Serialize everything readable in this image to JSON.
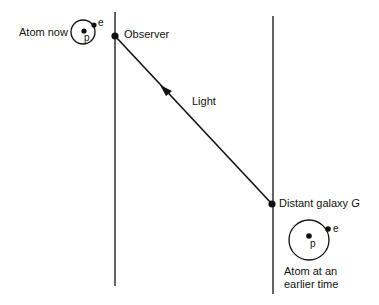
{
  "diagram": {
    "labels": {
      "atom_now": "Atom now",
      "observer": "Observer",
      "light": "Light",
      "distant_galaxy": "Distant galaxy ",
      "galaxy_symbol": "G",
      "atom_earlier_line1": "Atom at an",
      "atom_earlier_line2": "earlier time",
      "proton": "p",
      "electron": "e"
    },
    "colors": {
      "ink": "#111111",
      "background": "#ffffff"
    }
  }
}
